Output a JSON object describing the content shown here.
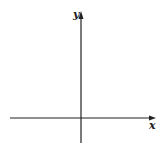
{
  "diagram": {
    "type": "cartesian-axes",
    "x_axis": {
      "label": "x",
      "direction": "right",
      "arrow": true
    },
    "y_axis": {
      "label": "y",
      "direction": "up",
      "arrow": true
    },
    "colors": {
      "line": "#222222",
      "background": "#ffffff"
    }
  }
}
